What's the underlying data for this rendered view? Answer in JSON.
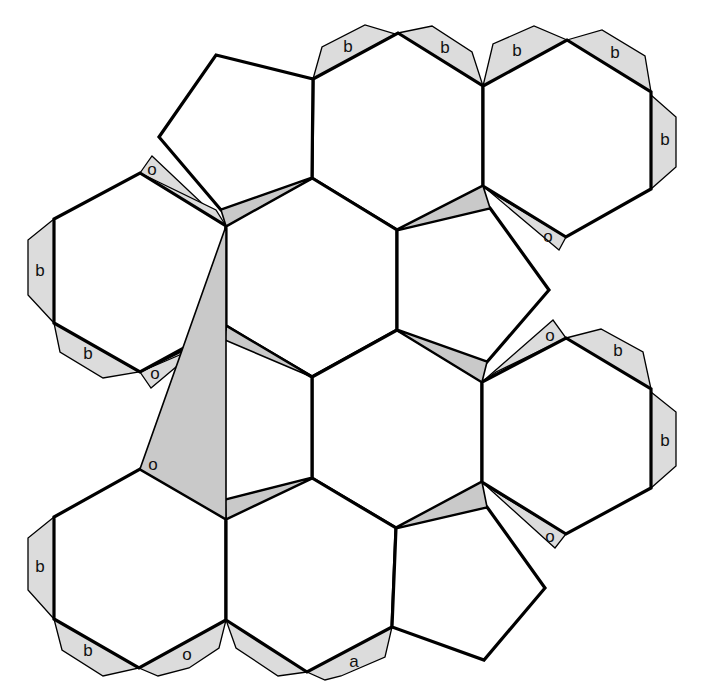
{
  "diagram": {
    "type": "polyhedron-net",
    "colors": {
      "face_fill": "#ffffff",
      "tab_fill": "#dcdcdc",
      "sliver_fill": "#c9c9c9",
      "stroke": "#000000"
    },
    "faces": {
      "hexagons": [
        {
          "id": "hex-top-middle",
          "points": "313,79 398,33 483,86 483,186 397,230 312,178"
        },
        {
          "id": "hex-top-right",
          "points": "483,86 567,40 651,92 651,189 566,237 483,186"
        },
        {
          "id": "hex-upper-left",
          "points": "140,173 226,226 226,325 140,372 54,323 54,219"
        },
        {
          "id": "hex-center-upper",
          "points": "312,178 397,230 397,330 312,377 226,326 226,226"
        },
        {
          "id": "hex-center-lower",
          "points": "397,330 482,382 482,482 396,528 312,478 312,377"
        },
        {
          "id": "hex-right-middle",
          "points": "482,382 566,338 651,389 651,488 566,534 482,482"
        },
        {
          "id": "hex-lower-left",
          "points": "140,469 226,519 226,620 139,668 54,619 54,517"
        },
        {
          "id": "hex-bottom-middle",
          "points": "312,478 396,528 392,627 307,672 226,620 226,519"
        }
      ],
      "pentagons": [
        {
          "id": "pent-top-left",
          "points": "216,55 313,79 312,178 221,210 159,137"
        },
        {
          "id": "pent-middle-right",
          "points": "397,230 490,208 549,290 487,362 397,330"
        },
        {
          "id": "pent-middle-left",
          "points": "226,326 312,377 312,478 225,500 166,418"
        },
        {
          "id": "pent-bottom-right",
          "points": "396,528 487,507 545,588 484,660 392,627"
        }
      ]
    },
    "tabs": [
      {
        "id": "tab-b-1",
        "label": "b",
        "points": "313,79 322,47 365,25 395,34",
        "lx": 348,
        "ly": 48
      },
      {
        "id": "tab-b-2",
        "label": "b",
        "points": "398,33 432,26 472,52 483,86",
        "lx": 445,
        "ly": 49
      },
      {
        "id": "tab-b-3",
        "label": "b",
        "points": "483,86 493,44 534,26 567,40",
        "lx": 517,
        "ly": 52
      },
      {
        "id": "tab-b-4",
        "label": "b",
        "points": "567,40 602,30 645,56 651,92",
        "lx": 615,
        "ly": 54
      },
      {
        "id": "tab-b-5",
        "label": "b",
        "points": "651,95 676,117 676,167 651,189",
        "lx": 665,
        "ly": 141
      },
      {
        "id": "tab-o-1",
        "label": "o",
        "points": "483,186 566,237 559,250",
        "lx": 548,
        "ly": 238
      },
      {
        "id": "tab-b-6",
        "label": "b",
        "points": "54,219 28,240 28,295 54,323",
        "lx": 40,
        "ly": 272
      },
      {
        "id": "tab-b-7",
        "label": "b",
        "points": "54,323 60,352 103,378 139,372",
        "lx": 88,
        "ly": 355
      },
      {
        "id": "tab-o-2",
        "label": "o",
        "points": "140,372 226,325 151,388",
        "lx": 155,
        "ly": 375
      },
      {
        "id": "tab-o-3",
        "label": "o",
        "points": "140,173 152,156 226,226",
        "lx": 152,
        "ly": 171
      },
      {
        "id": "tab-o-4",
        "label": "o",
        "points": "482,382 566,338 553,320",
        "lx": 550,
        "ly": 337
      },
      {
        "id": "tab-b-8",
        "label": "b",
        "points": "566,338 601,329 643,352 651,389",
        "lx": 618,
        "ly": 352
      },
      {
        "id": "tab-b-9",
        "label": "b",
        "points": "651,392 676,412 676,466 651,488",
        "lx": 665,
        "ly": 442
      },
      {
        "id": "tab-o-5",
        "label": "o",
        "points": "482,482 566,534 555,548",
        "lx": 550,
        "ly": 538
      },
      {
        "id": "tab-o-6",
        "label": "o",
        "points": "140,469 151,452 226,519",
        "lx": 153,
        "ly": 466
      },
      {
        "id": "tab-b-10",
        "label": "b",
        "points": "54,517 28,538 28,590 54,619",
        "lx": 40,
        "ly": 568
      },
      {
        "id": "tab-b-11",
        "label": "b",
        "points": "54,619 62,650 103,676 139,668",
        "lx": 88,
        "ly": 652
      },
      {
        "id": "tab-o-7",
        "label": "o",
        "points": "139,668 226,620 219,648 189,668 158,676",
        "lx": 187,
        "ly": 656
      },
      {
        "id": "tab-a-1",
        "label": "a",
        "points": "307,672 392,627 385,657 341,676 325,680",
        "lx": 354,
        "ly": 663
      },
      {
        "id": "tab-unlabeled-1",
        "points": "226,620 236,648 278,676 307,672"
      }
    ],
    "slivers": [
      {
        "id": "sliver-1",
        "points": "221,210 312,178 226,226"
      },
      {
        "id": "sliver-2",
        "points": "397,230 483,186 490,208"
      },
      {
        "id": "sliver-3",
        "points": "397,330 487,362 482,382"
      },
      {
        "id": "sliver-4",
        "points": "226,326 312,377 225,340"
      },
      {
        "id": "sliver-5",
        "points": "225,500 312,478 226,519"
      },
      {
        "id": "sliver-6",
        "points": "396,528 482,482 487,507"
      },
      {
        "id": "sliver-7",
        "points": "226,326 140,372 226,330"
      },
      {
        "id": "sliver-8",
        "points": "226,519 140,469 226,226"
      }
    ],
    "side_slivers": [
      {
        "id": "side-sliver-o3",
        "points": "140,173 226,226 216,210"
      },
      {
        "id": "side-sliver-o6",
        "points": "140,469 226,519 218,503"
      },
      {
        "id": "side-sliver-o1",
        "points": "483,186 566,237 497,196"
      },
      {
        "id": "side-sliver-o5",
        "points": "482,482 566,534 496,492"
      },
      {
        "id": "side-sliver-o2",
        "points": "226,325 140,372 212,341"
      },
      {
        "id": "side-sliver-o4",
        "points": "482,382 566,338 496,372"
      }
    ]
  }
}
